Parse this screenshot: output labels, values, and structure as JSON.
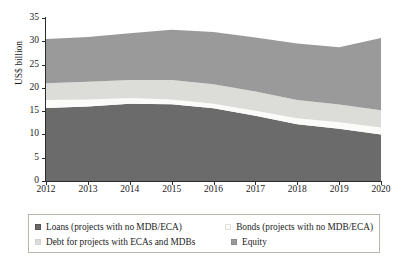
{
  "chart_data": {
    "type": "area",
    "title": "",
    "subtitle": "",
    "xlabel": "",
    "ylabel": "US$ billion",
    "x": [
      2012,
      2013,
      2014,
      2015,
      2016,
      2017,
      2018,
      2019,
      2020
    ],
    "xticklabels": [
      "2012",
      "2013",
      "2014",
      "2015",
      "2016",
      "2017",
      "2018",
      "2019",
      "2020"
    ],
    "yticklabels": [
      "0",
      "5",
      "10",
      "15",
      "20",
      "25",
      "30",
      "35"
    ],
    "yticks": [
      0,
      5,
      10,
      15,
      20,
      25,
      30,
      35
    ],
    "ylim": [
      0,
      35
    ],
    "xlim": [
      2012,
      2020
    ],
    "stacked": true,
    "grid": false,
    "legend_position": "bottom",
    "series": [
      {
        "name": "Loans (projects with no MDB/ECA)",
        "color": "#6b6b6b",
        "values": [
          15.7,
          16.0,
          16.6,
          16.5,
          15.6,
          14.0,
          12.2,
          11.2,
          10.0
        ]
      },
      {
        "name": "Bonds (projects with no MDB/ECA)",
        "color": "#fbfbf9",
        "values": [
          1.7,
          1.5,
          1.2,
          1.0,
          1.0,
          1.1,
          1.3,
          1.4,
          1.5
        ]
      },
      {
        "name": "Debt for projects with ECAs and MDBs",
        "color": "#dcdcd8",
        "values": [
          3.6,
          3.8,
          3.9,
          4.2,
          4.2,
          4.1,
          3.9,
          3.8,
          3.7
        ]
      },
      {
        "name": "Equity",
        "color": "#9a9a9a",
        "values": [
          9.5,
          9.6,
          10.0,
          10.8,
          11.2,
          11.6,
          12.1,
          12.3,
          15.5
        ]
      }
    ],
    "totals": [
      30.5,
      30.9,
      31.7,
      32.5,
      32.0,
      30.8,
      29.5,
      28.7,
      30.7
    ]
  },
  "legend": {
    "items": [
      {
        "label": "Loans (projects with no MDB/ECA)",
        "color": "#6b6b6b",
        "swatch_border": "#555555"
      },
      {
        "label": "Bonds (projects with no MDB/ECA)",
        "color": "#fbfbf9",
        "swatch_border": "#e2e2de"
      },
      {
        "label": "Debt for projects with ECAs and MDBs",
        "color": "#dcdcd8",
        "swatch_border": "#d2d2ce"
      },
      {
        "label": "Equity",
        "color": "#9a9a9a",
        "swatch_border": "#8a8a8a"
      }
    ]
  }
}
